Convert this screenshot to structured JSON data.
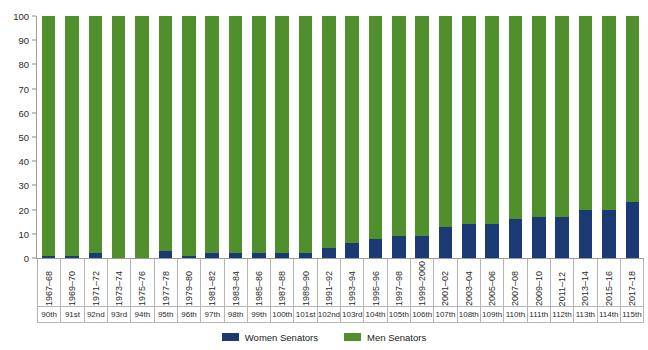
{
  "chart_data": {
    "type": "bar",
    "title": "",
    "subtitle": "",
    "xlabel": "",
    "ylabel": "",
    "ylim": [
      0,
      100
    ],
    "yticks": [
      0,
      10,
      20,
      30,
      40,
      50,
      60,
      70,
      80,
      90,
      100
    ],
    "grid": false,
    "stacked": true,
    "stack_total": 100,
    "legend_position": "bottom",
    "categories": [
      "1967–68",
      "1969–70",
      "1971–72",
      "1973–74",
      "1975–76",
      "1977–78",
      "1979–80",
      "1981–82",
      "1983–84",
      "1985–86",
      "1987–88",
      "1989–90",
      "1991–92",
      "1993–94",
      "1995–96",
      "1997–98",
      "1999–2000",
      "2001–02",
      "2003–04",
      "2005–06",
      "2007–08",
      "2009–10",
      "2011–12",
      "2013–14",
      "2015–16",
      "2017–18"
    ],
    "secondary_categories": [
      "90th",
      "91st",
      "92nd",
      "93rd",
      "94th",
      "95th",
      "96th",
      "97th",
      "98th",
      "99th",
      "100th",
      "101st",
      "102nd",
      "103rd",
      "104th",
      "105th",
      "106th",
      "107th",
      "108th",
      "109th",
      "110th",
      "111th",
      "112th",
      "113th",
      "114th",
      "115th"
    ],
    "series": [
      {
        "name": "Women Senators",
        "color": "#1b3a74",
        "values": [
          1,
          1,
          2,
          0,
          0,
          3,
          1,
          2,
          2,
          2,
          2,
          2,
          4,
          6,
          8,
          9,
          9,
          13,
          14,
          14,
          16,
          17,
          17,
          20,
          20,
          23
        ]
      },
      {
        "name": "Men Senators",
        "color": "#4f8f2c",
        "values": [
          99,
          99,
          98,
          100,
          100,
          97,
          99,
          98,
          98,
          98,
          98,
          98,
          96,
          94,
          92,
          91,
          91,
          87,
          86,
          86,
          84,
          83,
          83,
          80,
          80,
          77
        ]
      }
    ]
  },
  "legend": {
    "items": [
      {
        "label": "Women Senators",
        "color": "#1b3a74"
      },
      {
        "label": "Men Senators",
        "color": "#4f8f2c"
      }
    ]
  },
  "colors": {
    "women": "#1b3a74",
    "men": "#4f8f2c",
    "axis": "#9a9a9a",
    "grid_line": "#b5b5b5",
    "text": "#2b2b2b",
    "background": "#ffffff"
  }
}
